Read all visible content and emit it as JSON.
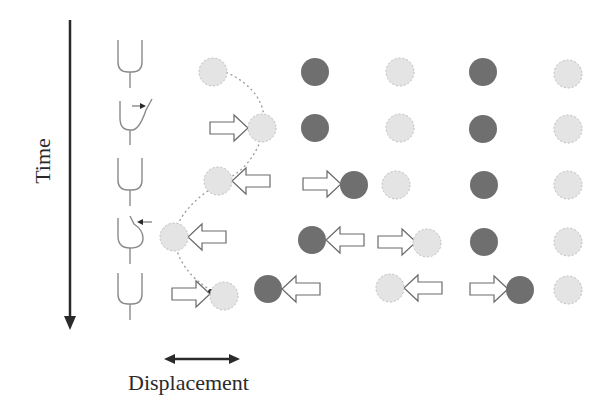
{
  "labels": {
    "time_axis": "Time",
    "displacement_axis": "Displacement"
  },
  "colors": {
    "light_particle": "#e4e4e4",
    "light_particle_border": "#bdbdbd",
    "dark_particle": "#6f6f6f",
    "arrow_stroke": "#6a6a6a",
    "axis": "#2a2a2a",
    "hair_cell": "#8a8a8a",
    "trajectory": "#9a9a9a"
  },
  "hair_cells": [
    {
      "row": 1,
      "state": "rest",
      "deflection": "none"
    },
    {
      "row": 2,
      "state": "bent-right",
      "deflection": "right"
    },
    {
      "row": 3,
      "state": "rest",
      "deflection": "none"
    },
    {
      "row": 4,
      "state": "bent-left",
      "deflection": "left"
    },
    {
      "row": 5,
      "state": "rest",
      "deflection": "none"
    }
  ],
  "rows": [
    {
      "particles": [
        {
          "x": 213,
          "y": 72,
          "shade": "light"
        },
        {
          "x": 315,
          "y": 72,
          "shade": "dark"
        },
        {
          "x": 400,
          "y": 72,
          "shade": "light"
        },
        {
          "x": 483,
          "y": 72,
          "shade": "dark"
        },
        {
          "x": 568,
          "y": 74,
          "shade": "light"
        }
      ],
      "arrows": []
    },
    {
      "particles": [
        {
          "x": 262,
          "y": 128,
          "shade": "light"
        },
        {
          "x": 315,
          "y": 128,
          "shade": "dark"
        },
        {
          "x": 400,
          "y": 128,
          "shade": "light"
        },
        {
          "x": 483,
          "y": 129,
          "shade": "dark"
        },
        {
          "x": 568,
          "y": 129,
          "shade": "light"
        }
      ],
      "arrows": [
        {
          "x": 210,
          "y": 128,
          "dir": "right"
        }
      ]
    },
    {
      "particles": [
        {
          "x": 218,
          "y": 181,
          "shade": "light"
        },
        {
          "x": 354,
          "y": 185,
          "shade": "dark"
        },
        {
          "x": 396,
          "y": 185,
          "shade": "light"
        },
        {
          "x": 484,
          "y": 185,
          "shade": "dark"
        },
        {
          "x": 568,
          "y": 185,
          "shade": "light"
        }
      ],
      "arrows": [
        {
          "x": 232,
          "y": 181,
          "dir": "left"
        },
        {
          "x": 303,
          "y": 184,
          "dir": "right"
        }
      ]
    },
    {
      "particles": [
        {
          "x": 174,
          "y": 237,
          "shade": "light"
        },
        {
          "x": 312,
          "y": 240,
          "shade": "dark"
        },
        {
          "x": 427,
          "y": 243,
          "shade": "light"
        },
        {
          "x": 484,
          "y": 242,
          "shade": "dark"
        },
        {
          "x": 568,
          "y": 242,
          "shade": "light"
        }
      ],
      "arrows": [
        {
          "x": 188,
          "y": 237,
          "dir": "left"
        },
        {
          "x": 326,
          "y": 240,
          "dir": "left"
        },
        {
          "x": 378,
          "y": 242,
          "dir": "right"
        }
      ]
    },
    {
      "particles": [
        {
          "x": 224,
          "y": 296,
          "shade": "light"
        },
        {
          "x": 268,
          "y": 289,
          "shade": "dark"
        },
        {
          "x": 390,
          "y": 288,
          "shade": "light"
        },
        {
          "x": 520,
          "y": 290,
          "shade": "dark"
        },
        {
          "x": 568,
          "y": 290,
          "shade": "light"
        }
      ],
      "arrows": [
        {
          "x": 172,
          "y": 294,
          "dir": "right"
        },
        {
          "x": 282,
          "y": 289,
          "dir": "left"
        },
        {
          "x": 404,
          "y": 288,
          "dir": "left"
        },
        {
          "x": 470,
          "y": 289,
          "dir": "right"
        }
      ]
    }
  ]
}
